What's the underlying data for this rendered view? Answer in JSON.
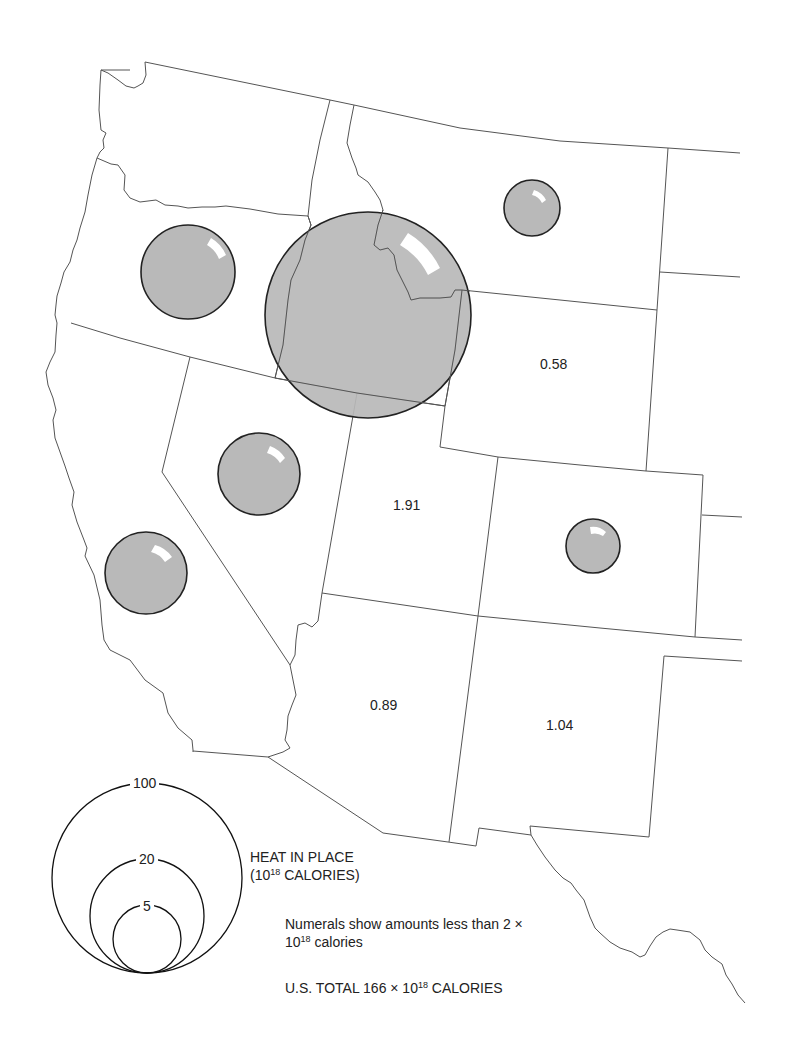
{
  "map": {
    "region": "Western United States",
    "symbol": "proportional circles",
    "bubble_color": "#b9b9b9",
    "bubbles": [
      {
        "state": "Oregon",
        "cx": 188,
        "cy": 272,
        "r": 47
      },
      {
        "state": "Idaho",
        "cx": 368,
        "cy": 315,
        "r": 103
      },
      {
        "state": "Montana",
        "cx": 532,
        "cy": 208,
        "r": 28
      },
      {
        "state": "Nevada",
        "cx": 259,
        "cy": 474,
        "r": 41
      },
      {
        "state": "California",
        "cx": 146,
        "cy": 573,
        "r": 41
      },
      {
        "state": "Colorado",
        "cx": 593,
        "cy": 546,
        "r": 27
      }
    ],
    "state_values": [
      {
        "state": "Wyoming",
        "value": "0.58"
      },
      {
        "state": "Utah",
        "value": "1.91"
      },
      {
        "state": "Arizona",
        "value": "0.89"
      },
      {
        "state": "New Mexico",
        "value": "1.04"
      }
    ]
  },
  "legend": {
    "circles": [
      {
        "label": "100"
      },
      {
        "label": "20"
      },
      {
        "label": "5"
      }
    ],
    "title_line1": "HEAT IN PLACE",
    "title_line2_prefix": "(10",
    "title_line2_sup": "18",
    "title_line2_suffix": " CALORIES)",
    "note_line1": "Numerals show amounts less than 2 ×",
    "note_line2_prefix": "10",
    "note_line2_sup": "18",
    "note_line2_suffix": " calories",
    "total_prefix": "U.S. TOTAL 166 × 10",
    "total_sup": "18",
    "total_suffix": " CALORIES"
  }
}
